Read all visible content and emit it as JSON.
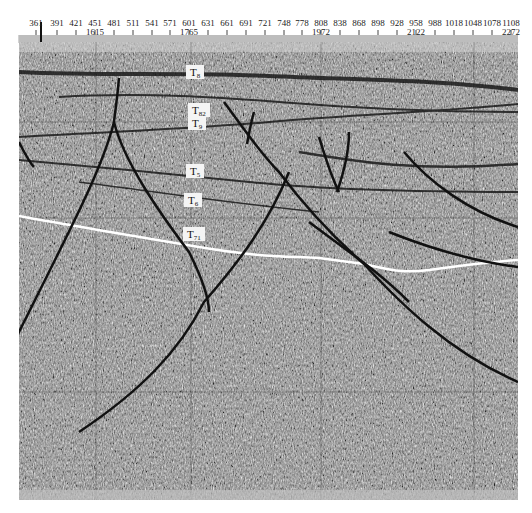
{
  "figure": {
    "type": "seismic-profile",
    "colors": {
      "background": "#ffffff",
      "fault_line": "#111111",
      "marker_horizon": "#ffffff",
      "seismic_base": "#8a8a8a"
    }
  },
  "ruler": {
    "trace_ticks": [
      {
        "label": "361",
        "x": 36
      },
      {
        "label": "391",
        "x": 57
      },
      {
        "label": "421",
        "x": 76
      },
      {
        "label": "451",
        "x": 95
      },
      {
        "label": "481",
        "x": 114
      },
      {
        "label": "511",
        "x": 133
      },
      {
        "label": "541",
        "x": 152
      },
      {
        "label": "571",
        "x": 170
      },
      {
        "label": "601",
        "x": 189
      },
      {
        "label": "631",
        "x": 208
      },
      {
        "label": "661",
        "x": 227
      },
      {
        "label": "691",
        "x": 246
      },
      {
        "label": "721",
        "x": 265
      },
      {
        "label": "748",
        "x": 284
      },
      {
        "label": "778",
        "x": 302
      },
      {
        "label": "808",
        "x": 321
      },
      {
        "label": "838",
        "x": 340
      },
      {
        "label": "868",
        "x": 359
      },
      {
        "label": "898",
        "x": 378
      },
      {
        "label": "928",
        "x": 397
      },
      {
        "label": "958",
        "x": 416
      },
      {
        "label": "988",
        "x": 435
      },
      {
        "label": "1018",
        "x": 454
      },
      {
        "label": "1048",
        "x": 473
      },
      {
        "label": "1078",
        "x": 492
      },
      {
        "label": "1108",
        "x": 511
      }
    ],
    "cdp_ticks": [
      {
        "label": "1615",
        "x": 95
      },
      {
        "label": "1765",
        "x": 189
      },
      {
        "label": "1972",
        "x": 321
      },
      {
        "label": "2122",
        "x": 416
      },
      {
        "label": "2272",
        "x": 511
      }
    ]
  },
  "horizons": [
    {
      "name": "T",
      "sub": "8",
      "x": 186,
      "y": 65
    },
    {
      "name": "T",
      "sub": "82",
      "x": 188,
      "y": 103
    },
    {
      "name": "T",
      "sub": "9",
      "x": 188,
      "y": 116
    },
    {
      "name": "T",
      "sub": "5",
      "x": 186,
      "y": 164
    },
    {
      "name": "T",
      "sub": "6",
      "x": 184,
      "y": 193
    },
    {
      "name": "T",
      "sub": "71",
      "x": 183,
      "y": 227
    }
  ]
}
